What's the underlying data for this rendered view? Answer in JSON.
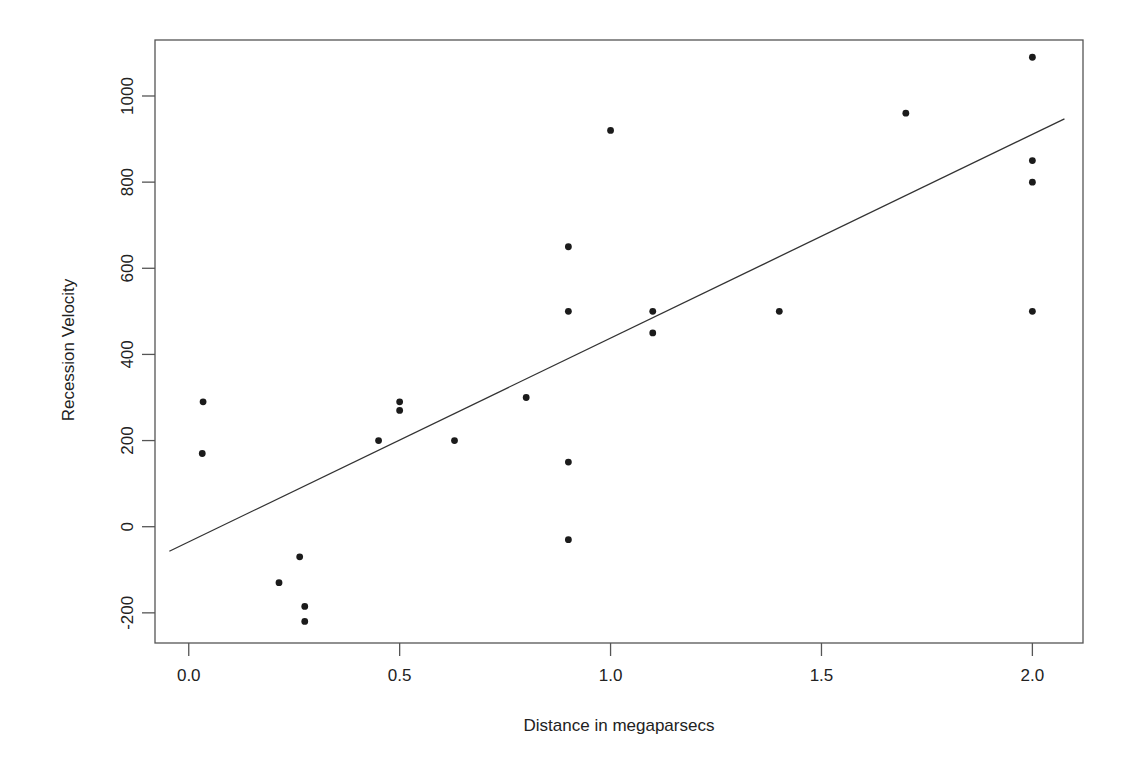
{
  "chart_data": {
    "type": "scatter",
    "title": "",
    "xlabel": "Distance in megaparsecs",
    "ylabel": "Recession Velocity",
    "xlim": [
      -0.08,
      2.12
    ],
    "ylim": [
      -270,
      1130
    ],
    "xticks": [
      0.0,
      0.5,
      1.0,
      1.5,
      2.0
    ],
    "xtick_labels": [
      "0.0",
      "0.5",
      "1.0",
      "1.5",
      "2.0"
    ],
    "yticks": [
      -200,
      0,
      200,
      400,
      600,
      800,
      1000
    ],
    "ytick_labels": [
      "-200",
      "0",
      "200",
      "400",
      "600",
      "800",
      "1000"
    ],
    "grid": false,
    "legend": false,
    "marker": "filled-circle",
    "marker_color": "#1b1b1b",
    "line_color": "#333333",
    "frame_color": "#555555",
    "series": [
      {
        "name": "galaxies",
        "points": [
          {
            "x": 0.032,
            "y": 170
          },
          {
            "x": 0.034,
            "y": 290
          },
          {
            "x": 0.214,
            "y": -130
          },
          {
            "x": 0.263,
            "y": -70
          },
          {
            "x": 0.275,
            "y": -185
          },
          {
            "x": 0.275,
            "y": -220
          },
          {
            "x": 0.45,
            "y": 200
          },
          {
            "x": 0.5,
            "y": 290
          },
          {
            "x": 0.5,
            "y": 270
          },
          {
            "x": 0.63,
            "y": 200
          },
          {
            "x": 0.8,
            "y": 300
          },
          {
            "x": 0.9,
            "y": -30
          },
          {
            "x": 0.9,
            "y": 650
          },
          {
            "x": 0.9,
            "y": 150
          },
          {
            "x": 0.9,
            "y": 500
          },
          {
            "x": 1.0,
            "y": 920
          },
          {
            "x": 1.1,
            "y": 450
          },
          {
            "x": 1.1,
            "y": 500
          },
          {
            "x": 1.4,
            "y": 500
          },
          {
            "x": 1.7,
            "y": 960
          },
          {
            "x": 2.0,
            "y": 500
          },
          {
            "x": 2.0,
            "y": 850
          },
          {
            "x": 2.0,
            "y": 800
          },
          {
            "x": 2.0,
            "y": 1090
          }
        ]
      }
    ],
    "fit_line": {
      "name": "least-squares fit",
      "x_start": -0.046,
      "y_start": -57,
      "x_end": 2.076,
      "y_end": 947,
      "slope": 473.0,
      "intercept": -35.2
    }
  },
  "figure": {
    "background": "#ffffff",
    "ink_color": "#1b1b1b"
  }
}
